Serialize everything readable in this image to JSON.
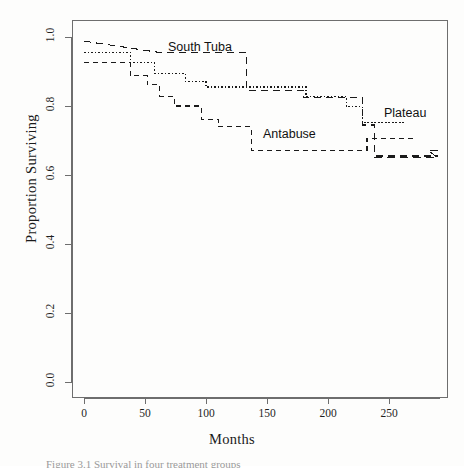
{
  "figure": {
    "caption_fragment": "Figure 3.1  Survival in four treatment groups"
  },
  "axes": {
    "x_title": "Months",
    "y_title": "Proportion Surviving",
    "x_ticks": [
      "0",
      "50",
      "100",
      "150",
      "200",
      "250"
    ],
    "y_ticks": [
      "0.0",
      "0.2",
      "0.4",
      "0.6",
      "0.8",
      "1.0"
    ]
  },
  "labels": {
    "south_tuba": "South Tuba",
    "antabuse": "Antabuse",
    "plateau": "Plateau"
  },
  "chart_data": {
    "type": "line",
    "title": "",
    "xlabel": "Months",
    "ylabel": "Proportion Surviving",
    "xlim": [
      0,
      290
    ],
    "ylim": [
      0.0,
      1.0
    ],
    "grid": false,
    "legend": "inline-annotations",
    "line_style_note": "All four step (Kaplan-Meier) curves drawn in black with differing dash patterns",
    "series": [
      {
        "name": "South Tuba",
        "dash": "long-dash",
        "label_position": {
          "x": 133,
          "y": 0.955
        },
        "steps": [
          {
            "x": 0,
            "y": 0.988
          },
          {
            "x": 62,
            "y": 0.955
          },
          {
            "x": 133,
            "y": 0.955
          },
          {
            "x": 133,
            "y": 0.845
          },
          {
            "x": 180,
            "y": 0.845
          },
          {
            "x": 180,
            "y": 0.825
          },
          {
            "x": 228,
            "y": 0.825
          },
          {
            "x": 228,
            "y": 0.745
          },
          {
            "x": 238,
            "y": 0.745
          },
          {
            "x": 238,
            "y": 0.655
          },
          {
            "x": 290,
            "y": 0.655
          }
        ]
      },
      {
        "name": "Plateau",
        "dash": "dotted",
        "label_position": {
          "x": 247,
          "y": 0.778
        },
        "steps": [
          {
            "x": 0,
            "y": 0.955
          },
          {
            "x": 38,
            "y": 0.955
          },
          {
            "x": 38,
            "y": 0.925
          },
          {
            "x": 58,
            "y": 0.925
          },
          {
            "x": 58,
            "y": 0.895
          },
          {
            "x": 83,
            "y": 0.895
          },
          {
            "x": 83,
            "y": 0.872
          },
          {
            "x": 100,
            "y": 0.872
          },
          {
            "x": 100,
            "y": 0.855
          },
          {
            "x": 182,
            "y": 0.855
          },
          {
            "x": 182,
            "y": 0.828
          },
          {
            "x": 215,
            "y": 0.828
          },
          {
            "x": 215,
            "y": 0.798
          },
          {
            "x": 228,
            "y": 0.798
          },
          {
            "x": 228,
            "y": 0.752
          },
          {
            "x": 262,
            "y": 0.752
          }
        ]
      },
      {
        "name": "Antabuse",
        "dash": "medium-dash",
        "label_position": {
          "x": 152,
          "y": 0.706
        },
        "steps": [
          {
            "x": 0,
            "y": 0.925
          },
          {
            "x": 38,
            "y": 0.925
          },
          {
            "x": 38,
            "y": 0.888
          },
          {
            "x": 52,
            "y": 0.888
          },
          {
            "x": 52,
            "y": 0.862
          },
          {
            "x": 62,
            "y": 0.862
          },
          {
            "x": 62,
            "y": 0.828
          },
          {
            "x": 74,
            "y": 0.828
          },
          {
            "x": 74,
            "y": 0.8
          },
          {
            "x": 96,
            "y": 0.8
          },
          {
            "x": 96,
            "y": 0.762
          },
          {
            "x": 110,
            "y": 0.762
          },
          {
            "x": 110,
            "y": 0.74
          },
          {
            "x": 137,
            "y": 0.74
          },
          {
            "x": 137,
            "y": 0.672
          },
          {
            "x": 232,
            "y": 0.672
          },
          {
            "x": 232,
            "y": 0.705
          },
          {
            "x": 272,
            "y": 0.705
          }
        ]
      },
      {
        "name": "unlabeled-fourth",
        "dash": "long-dash-lower",
        "steps": [
          {
            "x": 238,
            "y": 0.65
          },
          {
            "x": 290,
            "y": 0.65
          },
          {
            "x": 282,
            "y": 0.672
          },
          {
            "x": 290,
            "y": 0.672
          }
        ]
      }
    ]
  }
}
